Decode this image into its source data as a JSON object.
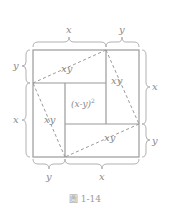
{
  "figure": {
    "caption": "圖 1-14",
    "top_labels": [
      "x",
      "y"
    ],
    "bottom_labels": [
      "y",
      "x"
    ],
    "left_labels": [
      "y",
      "x"
    ],
    "right_labels": [
      "x",
      "y"
    ],
    "region_labels": {
      "top": "xy",
      "right": "xy",
      "left": "xy",
      "bottom": "xy",
      "center": "(x-y)",
      "center_exponent": "2"
    },
    "colors": {
      "line": "#9a9a9a",
      "text": "#8a8a8a"
    }
  }
}
